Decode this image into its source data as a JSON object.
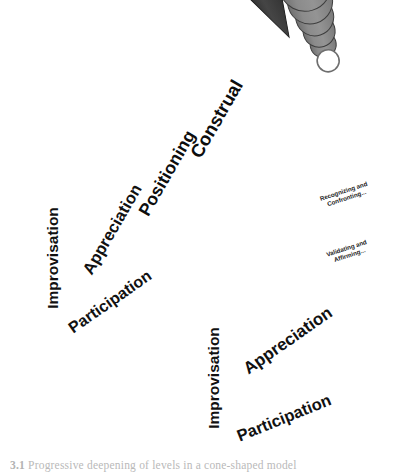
{
  "figure": {
    "background_color": "#ffffff",
    "caption": {
      "number": "3.1",
      "text": "Progressive deepening of levels in a cone-shaped model"
    }
  },
  "palette": {
    "improvisation": "#d9d9d9",
    "appreciation": "#b5b5b5",
    "participation": "#999999",
    "disc_face": "#8d8d8d",
    "disc_edge": "#4a4a4a",
    "cone_dark": "#1c1c1c",
    "cone_mid": "#5e5e5e",
    "cone_light": "#8a8a8a",
    "outline": "#2b2b2b",
    "apex_ring_fill": "#ffffff"
  },
  "left_cone": {
    "name": "smooth-cone",
    "style": "smooth gradient cone",
    "band_labels": [
      {
        "id": "construal",
        "label": "Construal"
      },
      {
        "id": "positioning",
        "label": "Positioning"
      }
    ],
    "base_circle": {
      "name": "base-pie-left",
      "segments": [
        {
          "id": "improvisation",
          "label": "Improvisation",
          "color": "#d9d9d9"
        },
        {
          "id": "appreciation",
          "label": "Appreciation",
          "color": "#b5b5b5"
        },
        {
          "id": "participation",
          "label": "Participation",
          "color": "#999999"
        }
      ]
    }
  },
  "right_cone": {
    "name": "stacked-disc-cone",
    "style": "stacked overlapping discs",
    "disc_count": 16,
    "apex_ring": {
      "id": "apex-ring",
      "label": ""
    },
    "mid_circle": {
      "name": "mid-pie-right",
      "segments": [
        {
          "id": "recognizing-confronting",
          "label": "Recognizing and Confronting..."
        },
        {
          "id": "validating-affirming",
          "label": "Validating and Affirming..."
        }
      ]
    },
    "base_circle": {
      "name": "base-pie-right",
      "segments": [
        {
          "id": "improvisation",
          "label": "Improvisation",
          "color": "#d9d9d9"
        },
        {
          "id": "appreciation",
          "label": "Appreciation",
          "color": "#b5b5b5"
        },
        {
          "id": "participation",
          "label": "Participation",
          "color": "#999999"
        }
      ]
    }
  }
}
